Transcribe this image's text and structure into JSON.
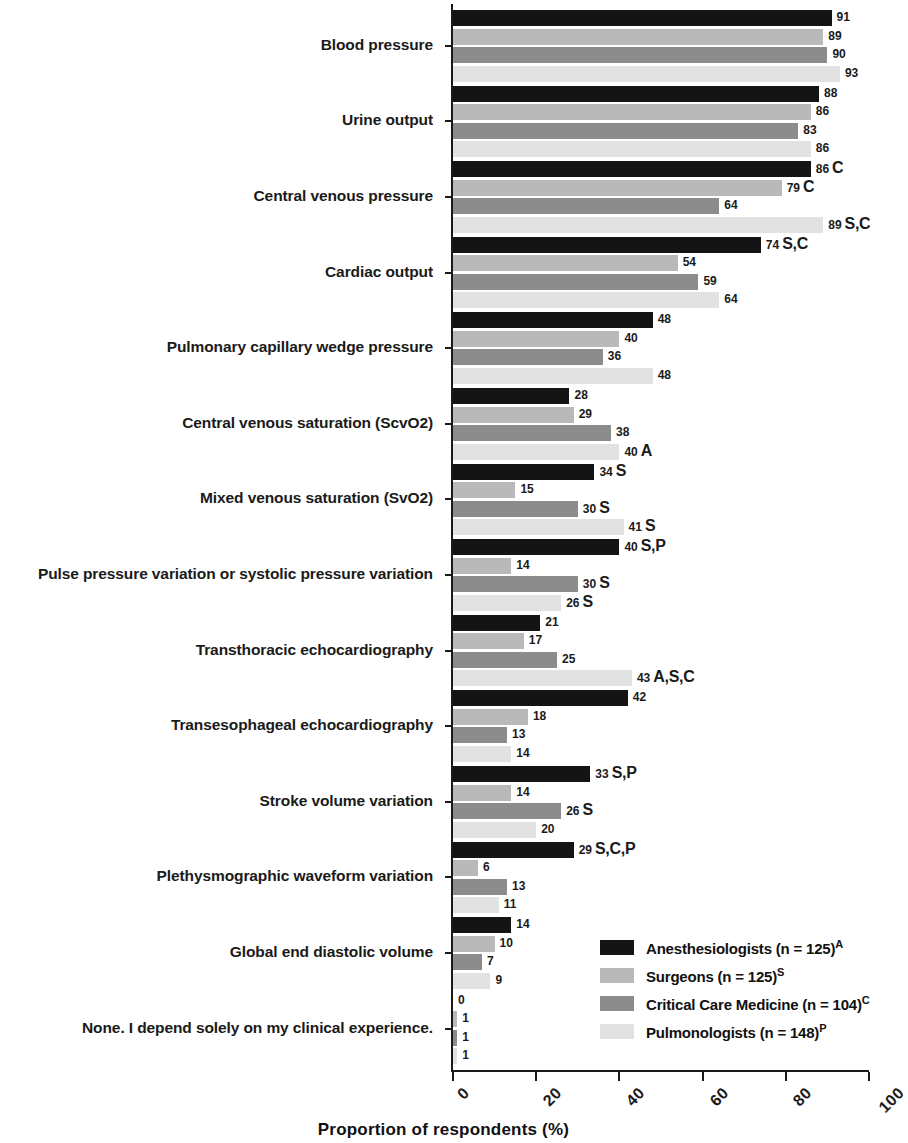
{
  "chart_data": {
    "type": "bar",
    "orientation": "horizontal",
    "grouped": true,
    "title": "",
    "xlabel": "Proportion of respondents (%)",
    "ylabel": "",
    "xlim": [
      0,
      100
    ],
    "xticks": [
      0,
      20,
      40,
      60,
      80,
      100
    ],
    "xtick_labels": [
      "0",
      "20",
      "40",
      "60",
      "80",
      "100"
    ],
    "grid": false,
    "legend_position": "inside-lower-right",
    "series": [
      {
        "name": "Anesthesiologists (n = 125)",
        "key": "A",
        "color": "#141414",
        "values": [
          91,
          88,
          86,
          74,
          48,
          28,
          34,
          40,
          21,
          42,
          33,
          29,
          14,
          0
        ]
      },
      {
        "name": "Surgeons (n = 125)",
        "key": "S",
        "color": "#b9b9b9",
        "values": [
          89,
          86,
          79,
          54,
          40,
          29,
          15,
          14,
          17,
          18,
          14,
          6,
          10,
          1
        ]
      },
      {
        "name": "Critical Care Medicine (n = 104)",
        "key": "C",
        "color": "#8c8c8c",
        "values": [
          90,
          83,
          64,
          59,
          36,
          38,
          30,
          30,
          25,
          13,
          26,
          13,
          7,
          1
        ]
      },
      {
        "name": "Pulmonologists (n = 148)",
        "key": "P",
        "color": "#e2e2e2",
        "values": [
          93,
          86,
          89,
          64,
          48,
          40,
          41,
          26,
          43,
          14,
          20,
          11,
          9,
          1
        ]
      }
    ],
    "categories": [
      "Blood pressure",
      "Urine output",
      "Central venous pressure",
      "Cardiac output",
      "Pulmonary capillary wedge pressure",
      "Central venous saturation (ScvO2)",
      "Mixed venous saturation (SvO2)",
      "Pulse pressure variation or systolic pressure variation",
      "Transthoracic echocardiography",
      "Transesophageal echocardiography",
      "Stroke volume variation",
      "Plethysmographic waveform variation",
      "Global end diastolic volume",
      "None. I depend solely on my clinical experience."
    ],
    "annotations": [
      [
        "",
        "",
        "",
        ""
      ],
      [
        "",
        "",
        "",
        ""
      ],
      [
        "C",
        "C",
        "",
        "S,C"
      ],
      [
        "S,C",
        "",
        "",
        ""
      ],
      [
        "",
        "",
        "",
        ""
      ],
      [
        "",
        "",
        "",
        "A"
      ],
      [
        "S",
        "",
        "S",
        "S"
      ],
      [
        "S,P",
        "",
        "S",
        "S"
      ],
      [
        "",
        "",
        "",
        "A,S,C"
      ],
      [
        "",
        "",
        "",
        ""
      ],
      [
        "S,P",
        "",
        "S",
        ""
      ],
      [
        "S,C,P",
        "",
        "",
        ""
      ],
      [
        "",
        "",
        "",
        ""
      ],
      [
        "",
        "",
        "",
        ""
      ]
    ]
  },
  "legend": {
    "items": [
      {
        "label": "Anesthesiologists (n = 125)",
        "sup": "A",
        "color": "#141414"
      },
      {
        "label": "Surgeons (n = 125)",
        "sup": "S",
        "color": "#b9b9b9"
      },
      {
        "label": "Critical Care Medicine (n = 104)",
        "sup": "C",
        "color": "#8c8c8c"
      },
      {
        "label": "Pulmonologists (n = 148)",
        "sup": "P",
        "color": "#e2e2e2"
      }
    ]
  },
  "axis": {
    "x_title": "Proportion of respondents (%)"
  }
}
